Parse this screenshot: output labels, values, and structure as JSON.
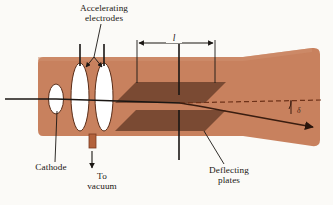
{
  "figure": {
    "background_color": "#fbfaf7",
    "tube_color": "#c8815e",
    "tube_edge_color": "#a4garbage",
    "plate_color": "#7a4a33",
    "line_color": "#1a1613",
    "beam_color": "#4a2212"
  },
  "labels": {
    "accelerating_electrodes": "Accelerating\nelectrodes",
    "cathode": "Cathode",
    "to_vacuum": "To\nvacuum",
    "deflecting_plates": "Deflecting\nplates",
    "length": "l",
    "angle": "δ"
  },
  "parts": [
    {
      "name": "cathode",
      "kind": "ellipse"
    },
    {
      "name": "accelerating-electrode-first",
      "kind": "ellipse"
    },
    {
      "name": "accelerating-electrode-second",
      "kind": "ellipse"
    },
    {
      "name": "deflecting-plate-upper",
      "kind": "parallelogram"
    },
    {
      "name": "deflecting-plate-lower",
      "kind": "parallelogram"
    },
    {
      "name": "vacuum-port",
      "kind": "stub"
    },
    {
      "name": "electron-beam",
      "kind": "arrow"
    },
    {
      "name": "tube-axis",
      "kind": "dashed-line"
    },
    {
      "name": "length-dimension",
      "kind": "double-arrow"
    }
  ]
}
